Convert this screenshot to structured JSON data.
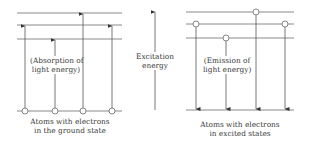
{
  "diagram": {
    "colors": {
      "line": "#8a8a8a",
      "arrow": "#333333",
      "text": "#3a3a3a",
      "background": "#ffffff"
    },
    "left_panel": {
      "title_line1": "Atoms with electrons",
      "title_line2": "in the ground state",
      "process_line1": "(Absorption of",
      "process_line2": "light energy)",
      "levels_y": [
        13,
        25,
        39,
        111
      ],
      "x_range": [
        17,
        122
      ],
      "electrons": [
        {
          "x": 25,
          "from_y": 111,
          "to_y": 25
        },
        {
          "x": 55,
          "from_y": 111,
          "to_y": 39
        },
        {
          "x": 83,
          "from_y": 111,
          "to_y": 13
        },
        {
          "x": 112,
          "from_y": 111,
          "to_y": 25
        }
      ]
    },
    "center": {
      "label_line1": "Excitation",
      "label_line2": "energy",
      "arrow_x": 155,
      "arrow_from_y": 110,
      "arrow_to_y": 11
    },
    "right_panel": {
      "title_line1": "Atoms with electrons",
      "title_line2": "in excited states",
      "process_line1": "(Emission of",
      "process_line2": "light energy)",
      "levels_y": [
        12,
        24,
        38,
        110
      ],
      "x_range": [
        186,
        294
      ],
      "electrons": [
        {
          "x": 196,
          "from_y": 24,
          "to_y": 110
        },
        {
          "x": 226,
          "from_y": 38,
          "to_y": 110
        },
        {
          "x": 256,
          "from_y": 12,
          "to_y": 110
        },
        {
          "x": 285,
          "from_y": 24,
          "to_y": 110
        }
      ]
    }
  }
}
